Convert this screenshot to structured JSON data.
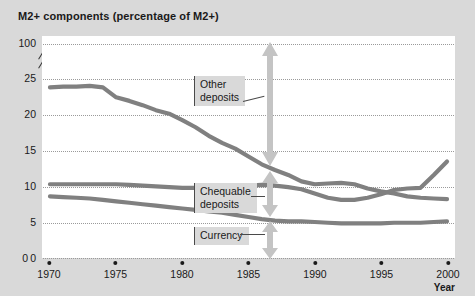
{
  "chart_data": {
    "type": "line",
    "title": "M2+ components (percentage of M2+)",
    "xlabel": "Year",
    "ylabel": "",
    "xlim": [
      1970,
      2000
    ],
    "ylim": [
      0,
      25
    ],
    "y_axis_break": true,
    "y_top_value": 100,
    "grid": true,
    "legend": "annotations",
    "ytick_labels": [
      "100",
      "25",
      "20",
      "15",
      "10",
      "5",
      "0"
    ],
    "ytick_values": [
      100,
      25,
      20,
      15,
      10,
      5,
      0
    ],
    "xtick_labels": [
      "1970",
      "1975",
      "1980",
      "1985",
      "1990",
      "1995",
      "2000"
    ],
    "xtick_values": [
      1970,
      1975,
      1980,
      1985,
      1990,
      1995,
      2000
    ],
    "x": [
      1970,
      1971,
      1972,
      1973,
      1974,
      1975,
      1976,
      1977,
      1978,
      1979,
      1980,
      1981,
      1982,
      1983,
      1984,
      1985,
      1986,
      1987,
      1988,
      1989,
      1990,
      1991,
      1992,
      1993,
      1994,
      1995,
      1996,
      1997,
      1998,
      1999,
      2000
    ],
    "series": [
      {
        "name": "Other deposits",
        "color": "#808080",
        "values": [
          23.8,
          23.9,
          23.9,
          24.0,
          23.8,
          22.4,
          21.9,
          21.3,
          20.6,
          20.1,
          19.2,
          18.2,
          17.0,
          16.0,
          15.2,
          14.1,
          13.0,
          12.2,
          11.5,
          10.6,
          10.2,
          10.3,
          10.4,
          10.2,
          9.6,
          9.2,
          8.9,
          8.5,
          8.3,
          8.2,
          8.1
        ]
      },
      {
        "name": "Chequable deposits",
        "color": "#808080",
        "values": [
          10.2,
          10.2,
          10.2,
          10.2,
          10.2,
          10.2,
          10.1,
          10.0,
          9.9,
          9.8,
          9.7,
          9.7,
          9.7,
          9.8,
          9.9,
          10.0,
          10.1,
          10.0,
          9.8,
          9.5,
          8.9,
          8.3,
          8.0,
          8.0,
          8.3,
          8.8,
          9.4,
          9.6,
          9.7,
          11.5,
          13.4
        ]
      },
      {
        "name": "Currency",
        "color": "#808080",
        "values": [
          8.5,
          8.4,
          8.3,
          8.2,
          8.0,
          7.8,
          7.6,
          7.4,
          7.2,
          7.0,
          6.8,
          6.6,
          6.4,
          6.2,
          5.9,
          5.6,
          5.3,
          5.1,
          5.0,
          5.0,
          4.9,
          4.8,
          4.7,
          4.7,
          4.7,
          4.7,
          4.8,
          4.8,
          4.8,
          4.9,
          5.0
        ]
      }
    ],
    "annotations": [
      {
        "label_line1": "Other",
        "label_line2": "deposits",
        "band": "Other deposits band"
      },
      {
        "label_line1": "Chequable",
        "label_line2": "deposits",
        "band": "Chequable deposits band"
      },
      {
        "label_line1": "Currency",
        "label_line2": "",
        "band": "Currency band"
      }
    ]
  }
}
